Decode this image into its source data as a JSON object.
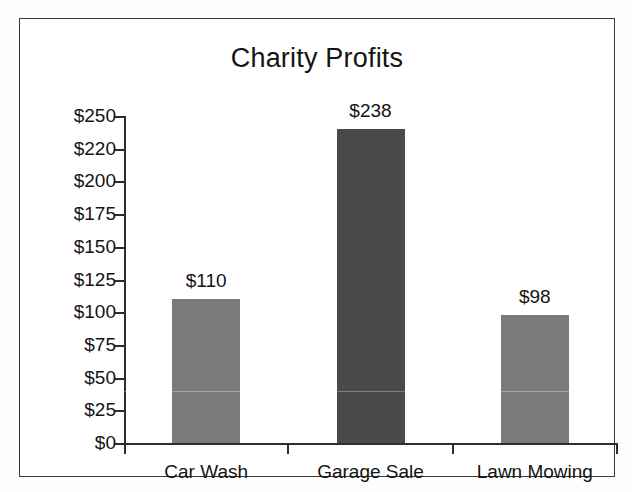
{
  "chart_data": {
    "type": "bar",
    "title": "Charity Profits",
    "xlabel": "",
    "ylabel": "",
    "categories": [
      "Car Wash",
      "Garage Sale",
      "Lawn Mowing"
    ],
    "values": [
      110,
      238,
      98
    ],
    "value_labels": [
      "$110",
      "$238",
      "$98"
    ],
    "bar_colors": [
      "#7a7a7a",
      "#4a4a4a",
      "#7a7a7a"
    ],
    "ytick_labels": [
      "$250",
      "$220",
      "$200",
      "$175",
      "$150",
      "$125",
      "$100",
      "$75",
      "$50",
      "$25",
      "$0"
    ],
    "ytick_values": [
      250,
      220,
      200,
      175,
      150,
      125,
      100,
      75,
      50,
      25,
      0
    ],
    "ylim": [
      0,
      250
    ],
    "grid": false,
    "legend": null
  },
  "figure": {
    "border_color": "#3a3a3a",
    "axis_color": "#2e2e2e",
    "background": "#ffffff",
    "text_color": "#141414"
  }
}
